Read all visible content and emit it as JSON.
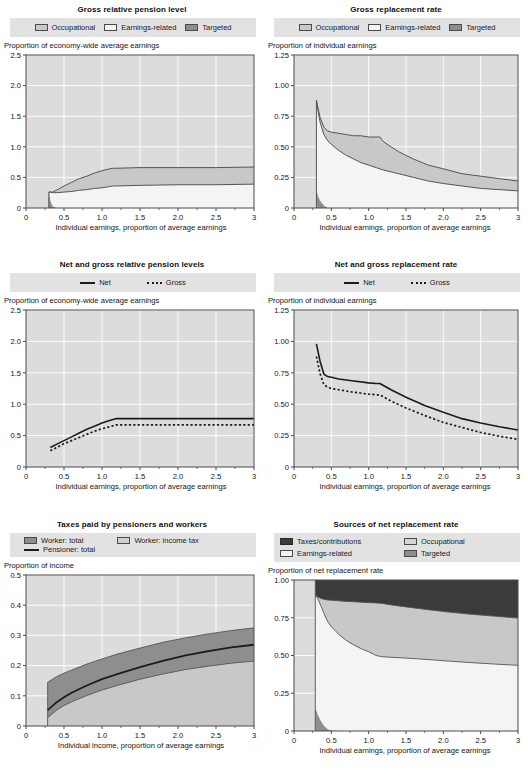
{
  "page": {
    "layout": "2 columns x 3 rows of charts"
  },
  "legend_labels": {
    "occupational": "Occupational",
    "earnings_related": "Earnings-related",
    "targeted": "Targeted",
    "net": "Net",
    "gross": "Gross",
    "worker_total": "Worker: total",
    "worker_income_tax": "Worker: income tax",
    "pensioner_total": "Pensioner: total",
    "taxes_contributions": "Taxes/contributions"
  },
  "colors": {
    "plot_background": "#dcdcdc",
    "gridline": "#ffffff",
    "axis": "#4a4a4a",
    "legend_background": "#e2e2e2",
    "occupational": "#c8c8c8",
    "earnings_related": "#f4f4f4",
    "targeted": "#8e8e8e",
    "taxes_contributions": "#3b3b3b",
    "line": "#1b1b1b"
  },
  "axis_titles": {
    "y_economy_wide": "Proportion of economy-wide average earnings",
    "y_individual": "Proportion of individual earnings",
    "y_income": "Proportion of income",
    "y_net_replacement": "Proportion of net replacement rate",
    "x_earnings": "Individual earnings, proportion of average earnings",
    "x_income": "Individual income, proportion of average earnings"
  },
  "chart_data": [
    {
      "id": "gross-relative-pension-level",
      "type": "area",
      "title": "Gross relative pension level",
      "xlabel": "Individual earnings, proportion of average earnings",
      "ylabel": "Proportion of economy-wide average earnings",
      "xlim": [
        0,
        3
      ],
      "ylim": [
        0,
        2.5
      ],
      "xticks": [
        "0",
        "0.5",
        "1.0",
        "1.5",
        "2.0",
        "2.5",
        "3"
      ],
      "yticks": [
        "0",
        "0.5",
        "1.0",
        "1.5",
        "2.0",
        "2.5"
      ],
      "grid": true,
      "legend_position": "top",
      "x": [
        0.3,
        0.32,
        0.35,
        0.4,
        0.5,
        0.6,
        0.7,
        0.8,
        0.9,
        1.0,
        1.1,
        1.15,
        1.2,
        1.5,
        2.0,
        2.5,
        3.0
      ],
      "series": [
        {
          "name": "Targeted",
          "values": [
            0.26,
            0.12,
            0.03,
            0.0,
            0.0,
            0.0,
            0.0,
            0.0,
            0.0,
            0.0,
            0.0,
            0.0,
            0.0,
            0.0,
            0.0,
            0.0,
            0.0
          ]
        },
        {
          "name": "Earnings-related",
          "values": [
            0.0,
            0.14,
            0.22,
            0.25,
            0.26,
            0.27,
            0.29,
            0.3,
            0.32,
            0.33,
            0.35,
            0.36,
            0.36,
            0.37,
            0.38,
            0.38,
            0.39
          ]
        },
        {
          "name": "Occupational",
          "values": [
            0.0,
            0.0,
            0.01,
            0.04,
            0.1,
            0.15,
            0.19,
            0.22,
            0.25,
            0.28,
            0.29,
            0.29,
            0.29,
            0.29,
            0.28,
            0.28,
            0.28
          ]
        }
      ],
      "stacked_tops": {
        "targeted_top": [
          0.26,
          0.12,
          0.03,
          0.0,
          0.0,
          0.0,
          0.0,
          0.0,
          0.0,
          0.0,
          0.0,
          0.0,
          0.0,
          0.0,
          0.0,
          0.0,
          0.0
        ],
        "earnings_top": [
          0.26,
          0.26,
          0.25,
          0.25,
          0.26,
          0.27,
          0.29,
          0.3,
          0.32,
          0.33,
          0.35,
          0.36,
          0.36,
          0.37,
          0.38,
          0.38,
          0.39
        ],
        "total_top": [
          0.26,
          0.26,
          0.26,
          0.29,
          0.36,
          0.42,
          0.48,
          0.52,
          0.57,
          0.61,
          0.64,
          0.65,
          0.65,
          0.66,
          0.66,
          0.66,
          0.67
        ]
      }
    },
    {
      "id": "gross-replacement-rate",
      "type": "area",
      "title": "Gross replacement rate",
      "xlabel": "Individual earnings, proportion of average earnings",
      "ylabel": "Proportion of individual earnings",
      "xlim": [
        0,
        3
      ],
      "ylim": [
        0,
        1.25
      ],
      "xticks": [
        "0",
        "0.5",
        "1.0",
        "1.5",
        "2.0",
        "2.5",
        "3"
      ],
      "yticks": [
        "0",
        "0.25",
        "0.50",
        "0.75",
        "1.00",
        "1.25"
      ],
      "grid": true,
      "legend_position": "top",
      "x": [
        0.3,
        0.32,
        0.35,
        0.4,
        0.45,
        0.5,
        0.6,
        0.7,
        0.8,
        0.9,
        1.0,
        1.1,
        1.15,
        1.2,
        1.4,
        1.6,
        1.8,
        2.0,
        2.25,
        2.5,
        2.75,
        3.0
      ],
      "stacked_tops": {
        "targeted_top": [
          0.15,
          0.1,
          0.06,
          0.02,
          0.0,
          0.0,
          0.0,
          0.0,
          0.0,
          0.0,
          0.0,
          0.0,
          0.0,
          0.0,
          0.0,
          0.0,
          0.0,
          0.0,
          0.0,
          0.0,
          0.0,
          0.0
        ],
        "earnings_top": [
          0.88,
          0.8,
          0.7,
          0.6,
          0.55,
          0.52,
          0.47,
          0.43,
          0.4,
          0.37,
          0.35,
          0.33,
          0.32,
          0.31,
          0.28,
          0.25,
          0.22,
          0.2,
          0.18,
          0.16,
          0.15,
          0.14
        ],
        "total_top": [
          0.88,
          0.82,
          0.74,
          0.66,
          0.63,
          0.62,
          0.61,
          0.6,
          0.59,
          0.59,
          0.58,
          0.58,
          0.58,
          0.54,
          0.46,
          0.4,
          0.35,
          0.32,
          0.28,
          0.26,
          0.24,
          0.22
        ]
      }
    },
    {
      "id": "net-and-gross-relative-pension-levels",
      "type": "line",
      "title": "Net and gross relative pension levels",
      "xlabel": "Individual earnings, proportion of average earnings",
      "ylabel": "Proportion of economy-wide average earnings",
      "xlim": [
        0,
        3
      ],
      "ylim": [
        0,
        2.5
      ],
      "xticks": [
        "0",
        "0.5",
        "1.0",
        "1.5",
        "2.0",
        "2.5",
        "3"
      ],
      "yticks": [
        "0",
        "0.5",
        "1.0",
        "1.5",
        "2.0",
        "2.5"
      ],
      "grid": true,
      "legend_position": "top",
      "x": [
        0.32,
        0.4,
        0.5,
        0.6,
        0.7,
        0.8,
        0.9,
        1.0,
        1.1,
        1.18,
        1.4,
        1.8,
        2.2,
        2.6,
        3.0
      ],
      "series": [
        {
          "name": "Net",
          "values": [
            0.31,
            0.36,
            0.42,
            0.48,
            0.54,
            0.6,
            0.65,
            0.7,
            0.74,
            0.77,
            0.77,
            0.77,
            0.77,
            0.77,
            0.77
          ]
        },
        {
          "name": "Gross",
          "values": [
            0.26,
            0.31,
            0.37,
            0.42,
            0.47,
            0.52,
            0.57,
            0.61,
            0.64,
            0.67,
            0.67,
            0.67,
            0.67,
            0.67,
            0.67
          ]
        }
      ]
    },
    {
      "id": "net-and-gross-replacement-rate",
      "type": "line",
      "title": "Net and gross replacement rate",
      "xlabel": "Individual earnings, proportion of average earnings",
      "ylabel": "Proportion of individual earnings",
      "xlim": [
        0,
        3
      ],
      "ylim": [
        0,
        1.25
      ],
      "xticks": [
        "0",
        "0.5",
        "1.0",
        "1.5",
        "2.0",
        "2.5",
        "3"
      ],
      "yticks": [
        "0",
        "0.25",
        "0.50",
        "0.75",
        "1.00",
        "1.25"
      ],
      "grid": true,
      "legend_position": "top",
      "x": [
        0.3,
        0.35,
        0.4,
        0.45,
        0.5,
        0.6,
        0.8,
        1.0,
        1.1,
        1.15,
        1.3,
        1.5,
        1.75,
        2.0,
        2.25,
        2.5,
        2.75,
        3.0
      ],
      "series": [
        {
          "name": "Net",
          "values": [
            0.98,
            0.84,
            0.74,
            0.72,
            0.715,
            0.7,
            0.685,
            0.67,
            0.665,
            0.665,
            0.615,
            0.555,
            0.49,
            0.435,
            0.385,
            0.35,
            0.32,
            0.295
          ]
        },
        {
          "name": "Gross",
          "values": [
            0.88,
            0.74,
            0.655,
            0.635,
            0.625,
            0.615,
            0.595,
            0.58,
            0.575,
            0.575,
            0.525,
            0.47,
            0.41,
            0.355,
            0.315,
            0.275,
            0.245,
            0.22
          ]
        }
      ]
    },
    {
      "id": "taxes-paid-by-pensioners-and-workers",
      "type": "area",
      "title": "Taxes paid by pensioners and workers",
      "xlabel": "Individual income, proportion of average earnings",
      "ylabel": "Proportion of income",
      "xlim": [
        0,
        3
      ],
      "ylim": [
        0,
        0.5
      ],
      "xticks": [
        "0",
        "0.5",
        "1.0",
        "1.5",
        "2.0",
        "2.5",
        "3"
      ],
      "yticks": [
        "0",
        "0.1",
        "0.2",
        "0.3",
        "0.4",
        "0.5"
      ],
      "grid": true,
      "legend_position": "top",
      "x": [
        0.285,
        0.3,
        0.4,
        0.5,
        0.6,
        0.8,
        1.0,
        1.2,
        1.5,
        1.8,
        2.1,
        2.4,
        2.7,
        3.0
      ],
      "series": [
        {
          "name": "Worker: total",
          "values": [
            0.145,
            0.147,
            0.163,
            0.175,
            0.185,
            0.205,
            0.222,
            0.238,
            0.258,
            0.277,
            0.292,
            0.305,
            0.316,
            0.325
          ]
        },
        {
          "name": "Worker: income tax",
          "values": [
            0.028,
            0.031,
            0.052,
            0.068,
            0.08,
            0.101,
            0.119,
            0.134,
            0.155,
            0.172,
            0.187,
            0.198,
            0.208,
            0.215
          ]
        },
        {
          "name": "Pensioner: total",
          "values": [
            0.053,
            0.056,
            0.078,
            0.095,
            0.11,
            0.134,
            0.155,
            0.172,
            0.195,
            0.216,
            0.234,
            0.248,
            0.26,
            0.269
          ]
        }
      ]
    },
    {
      "id": "sources-of-net-replacement-rate",
      "type": "area",
      "title": "Sources of net replacement rate",
      "xlabel": "Individual earnings, proportion of average earnings",
      "ylabel": "Proportion of net replacement rate",
      "xlim": [
        0,
        3
      ],
      "ylim": [
        0,
        1.0
      ],
      "xticks": [
        "0",
        "0.5",
        "1.0",
        "1.5",
        "2.0",
        "2.5",
        "3"
      ],
      "yticks": [
        "0",
        "0.25",
        "0.50",
        "0.75",
        "1.00"
      ],
      "grid": true,
      "legend_position": "top",
      "x": [
        0.285,
        0.3,
        0.32,
        0.36,
        0.4,
        0.45,
        0.5,
        0.6,
        0.7,
        0.8,
        0.9,
        1.0,
        1.1,
        1.18,
        1.3,
        1.5,
        1.8,
        2.1,
        2.4,
        2.7,
        3.0
      ],
      "stacked_tops": {
        "targeted_top": [
          0.145,
          0.135,
          0.105,
          0.065,
          0.035,
          0.012,
          0.004,
          0.0,
          0.0,
          0.0,
          0.0,
          0.0,
          0.0,
          0.0,
          0.0,
          0.0,
          0.0,
          0.0,
          0.0,
          0.0,
          0.0
        ],
        "earnings_top": [
          0.895,
          0.893,
          0.875,
          0.83,
          0.78,
          0.725,
          0.69,
          0.64,
          0.6,
          0.57,
          0.545,
          0.525,
          0.5,
          0.492,
          0.488,
          0.483,
          0.473,
          0.462,
          0.452,
          0.443,
          0.435
        ],
        "occupational_top": [
          0.895,
          0.895,
          0.888,
          0.878,
          0.872,
          0.868,
          0.866,
          0.862,
          0.858,
          0.856,
          0.853,
          0.85,
          0.848,
          0.845,
          0.835,
          0.822,
          0.803,
          0.786,
          0.772,
          0.76,
          0.748
        ]
      }
    }
  ]
}
